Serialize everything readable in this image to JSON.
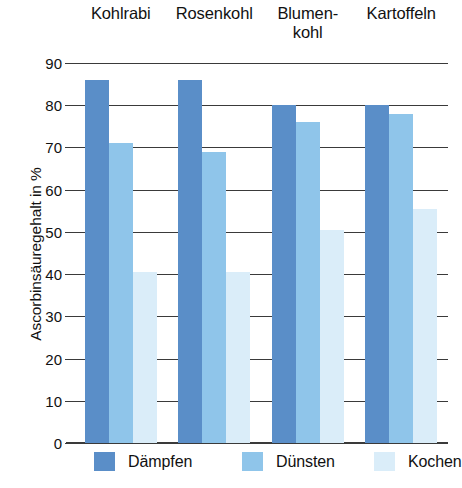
{
  "chart_data": {
    "type": "bar",
    "title": "",
    "xlabel": "",
    "ylabel": "Ascorbinsäuregehalt in %",
    "ylim": [
      0,
      90
    ],
    "ytick_step": 10,
    "yticks": [
      0,
      10,
      20,
      30,
      40,
      50,
      60,
      70,
      80,
      90
    ],
    "grid": true,
    "grid_axis": "y",
    "legend_position": "bottom",
    "categories": [
      "Kohlrabi",
      "Rosenkohl",
      "Blumen-\nkohl",
      "Kartoffeln"
    ],
    "category_labels_plain": [
      "Kohlrabi",
      "Rosenkohl",
      "Blumenkohl",
      "Kartoffeln"
    ],
    "series": [
      {
        "name": "Dämpfen",
        "color": "#5a8ec8",
        "values": [
          86,
          86,
          80,
          80
        ]
      },
      {
        "name": "Dünsten",
        "color": "#8fc5ea",
        "values": [
          71,
          69,
          76,
          78
        ]
      },
      {
        "name": "Kochen",
        "color": "#daedf9",
        "values": [
          40.5,
          40.5,
          50.5,
          55.5
        ]
      }
    ]
  },
  "colors": {
    "daempfen": "#5a8ec8",
    "duensten": "#8fc5ea",
    "kochen": "#daedf9",
    "axis": "#3a3a3a",
    "text": "#111111",
    "background": "#ffffff"
  }
}
